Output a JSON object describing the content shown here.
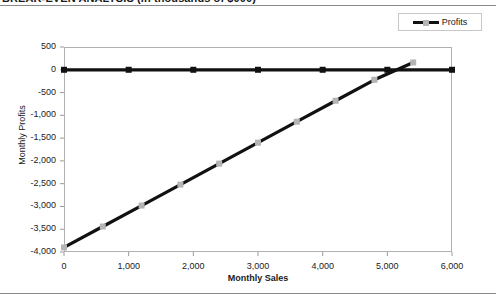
{
  "title": "BREAK-EVEN ANALYSIS  (in thousands of $000)",
  "legend": {
    "position": "top-right",
    "entries": [
      {
        "label": "Profits",
        "line_color": "#111111",
        "marker_color": "#b4b4b4"
      }
    ]
  },
  "chart_data": {
    "type": "line",
    "title": "BREAK-EVEN ANALYSIS  (in thousands of $000)",
    "xlabel": "Monthly Sales",
    "ylabel": "Monthly Profits",
    "xlim": [
      0,
      6000
    ],
    "ylim": [
      -4000,
      500
    ],
    "grid": false,
    "legend_position": "top-right",
    "xticks": [
      0,
      1000,
      2000,
      3000,
      4000,
      5000,
      6000
    ],
    "xtick_labels": [
      "0",
      "1,000",
      "2,000",
      "3,000",
      "4,000",
      "5,000",
      "6,000"
    ],
    "yticks": [
      500,
      0,
      -500,
      -1000,
      -1500,
      -2000,
      -2500,
      -3000,
      -3500,
      -4000
    ],
    "ytick_labels": [
      "500",
      "0",
      "-500",
      "-1,000",
      "-1,500",
      "-2,000",
      "-2,500",
      "-3,000",
      "-3,500",
      "-4,000"
    ],
    "series": [
      {
        "name": "Zero reference",
        "color": "#111111",
        "marker": "square",
        "marker_color": "#111111",
        "x": [
          0,
          1000,
          2000,
          3000,
          4000,
          5000,
          6000
        ],
        "values": [
          0,
          0,
          0,
          0,
          0,
          0,
          0
        ]
      },
      {
        "name": "Profits",
        "color": "#111111",
        "marker": "square",
        "marker_color": "#b4b4b4",
        "x": [
          0,
          600,
          1200,
          1800,
          2400,
          3000,
          3600,
          4200,
          4800,
          5400
        ],
        "values": [
          -3900,
          -3440,
          -2980,
          -2520,
          -2060,
          -1600,
          -1140,
          -680,
          -220,
          160
        ]
      }
    ],
    "annotations": {
      "break_even_sales": 5100,
      "intercept": -3900,
      "slope_per_unit_sales": 0.765
    }
  }
}
